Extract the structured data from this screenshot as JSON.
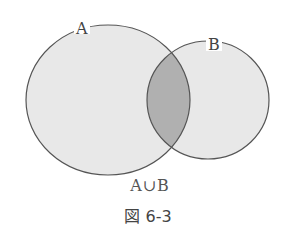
{
  "diagram": {
    "type": "venn",
    "sets": [
      {
        "label": "A",
        "cx": 108,
        "cy": 100,
        "rx": 82,
        "ry": 75
      },
      {
        "label": "B",
        "cx": 208,
        "cy": 100,
        "rx": 61,
        "ry": 59
      }
    ],
    "highlighted_region": "A∩B",
    "colors": {
      "set_fill": "#e8e8e8",
      "overlap_fill": "#b0b0b0",
      "stroke": "#555555"
    },
    "union_label": "A∪B",
    "caption": "図 6-3"
  },
  "labels": {
    "set_a": "A",
    "set_b": "B"
  }
}
